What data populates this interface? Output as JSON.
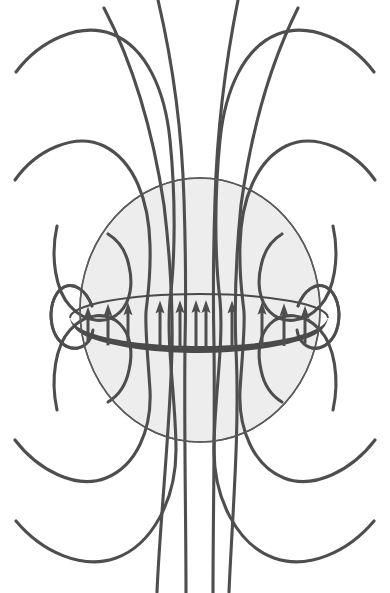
{
  "figure": {
    "caption": "",
    "background_color": "#ffffff",
    "line_color": "#4e4e4e",
    "sphere_fill_color": "#ededed",
    "sphere_outline_color": "#5a5a5a",
    "ring_color": "#4a4a4a",
    "width": 390,
    "height": 593
  },
  "chart_data": {
    "type": "diagram",
    "xlabel": "",
    "ylabel": "",
    "grid": false,
    "legend": "none",
    "elements": {
      "current_ring": {
        "label": "current loop",
        "center_x": 199,
        "center_y": 318,
        "radius_x": 129,
        "radius_y": 24,
        "band_thickness": 14,
        "color": "#4a4a4a"
      },
      "shaded_sphere": {
        "label": "field source region",
        "center_x": 200,
        "center_y": 310,
        "radius_x": 120,
        "radius_y": 132,
        "fill": "#ededed",
        "outline": "#5a5a5a"
      },
      "arrows": {
        "label": "field direction through loop (upward)",
        "count": 11,
        "direction": "up",
        "x_positions": [
          88,
          108,
          128,
          160,
          180,
          196,
          206,
          232,
          262,
          284,
          305
        ],
        "tip_y": 300,
        "tail_y": 330
      },
      "field_lines": {
        "label": "magnetic field lines",
        "symmetry": "mirror about vertical and horizontal axis",
        "families": [
          {
            "name": "inner-tight-loop-left",
            "count": 1
          },
          {
            "name": "mid-loop-left",
            "count": 1
          },
          {
            "name": "outer-loop-left",
            "count": 1
          },
          {
            "name": "far-loop-left",
            "count": 1
          },
          {
            "name": "central-lines",
            "count": 4
          },
          {
            "name": "inner-tight-loop-right",
            "count": 1
          },
          {
            "name": "mid-loop-right",
            "count": 1
          },
          {
            "name": "outer-loop-right",
            "count": 1
          },
          {
            "name": "far-loop-right",
            "count": 1
          }
        ]
      }
    }
  }
}
